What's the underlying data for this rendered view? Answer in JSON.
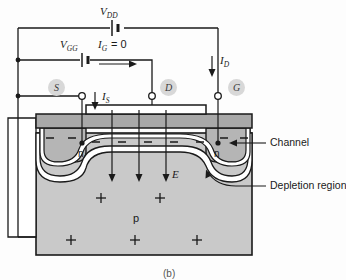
{
  "figure": {
    "caption": "(b)"
  },
  "sources": {
    "vdd_label": "V",
    "vdd_sub": "DD",
    "vgg_label": "V",
    "vgg_sub": "GG"
  },
  "currents": {
    "ig_label": "I",
    "ig_sub": "G",
    "ig_value": "= 0",
    "id_label": "I",
    "id_sub": "D",
    "is_label": "I",
    "is_sub": "S"
  },
  "terminals": [
    {
      "name": "source",
      "label": "S"
    },
    {
      "name": "drain",
      "label": "D"
    },
    {
      "name": "gate",
      "label": "G"
    }
  ],
  "device": {
    "source_region_label": "n",
    "drain_region_label": "n",
    "substrate_label": "p",
    "field_label": "E"
  },
  "callouts": [
    {
      "name": "channel",
      "label": "Channel"
    },
    {
      "name": "depletion-region",
      "label": "Depletion region"
    }
  ],
  "colors": {
    "wire": "#1a1a1a",
    "oxide": "#a8a8a8",
    "substrate": "#c9c9c9",
    "n_region": "#b5b5b5",
    "channel": "#ffffff",
    "terminal_badge": "#d8d8d8",
    "gate_metal": "#ffffff",
    "background": "#fdfdfd"
  },
  "charges": {
    "negative_symbol": "−",
    "positive_symbol": "+",
    "negative_count": 9,
    "positive_count": 7
  }
}
